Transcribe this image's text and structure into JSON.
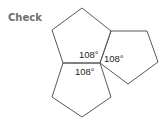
{
  "title": "Check",
  "colors": {
    "title": "#6d6e70",
    "stroke": "#58595b",
    "label": "#231f20"
  },
  "shapes": [
    {
      "name": "top-pentagon",
      "points": "82,8 111,31 100,63 63,63 52,30"
    },
    {
      "name": "right-pentagon",
      "points": "111,31 147,31 158,62 128,84 100,63"
    },
    {
      "name": "bottom-pentagon",
      "points": "63,63 100,63 111,97 82,117 52,97"
    }
  ],
  "labels": [
    {
      "text": "108°",
      "x": 79,
      "y": 58
    },
    {
      "text": "108°",
      "x": 104,
      "y": 62
    },
    {
      "text": "108°",
      "x": 75,
      "y": 75
    }
  ]
}
